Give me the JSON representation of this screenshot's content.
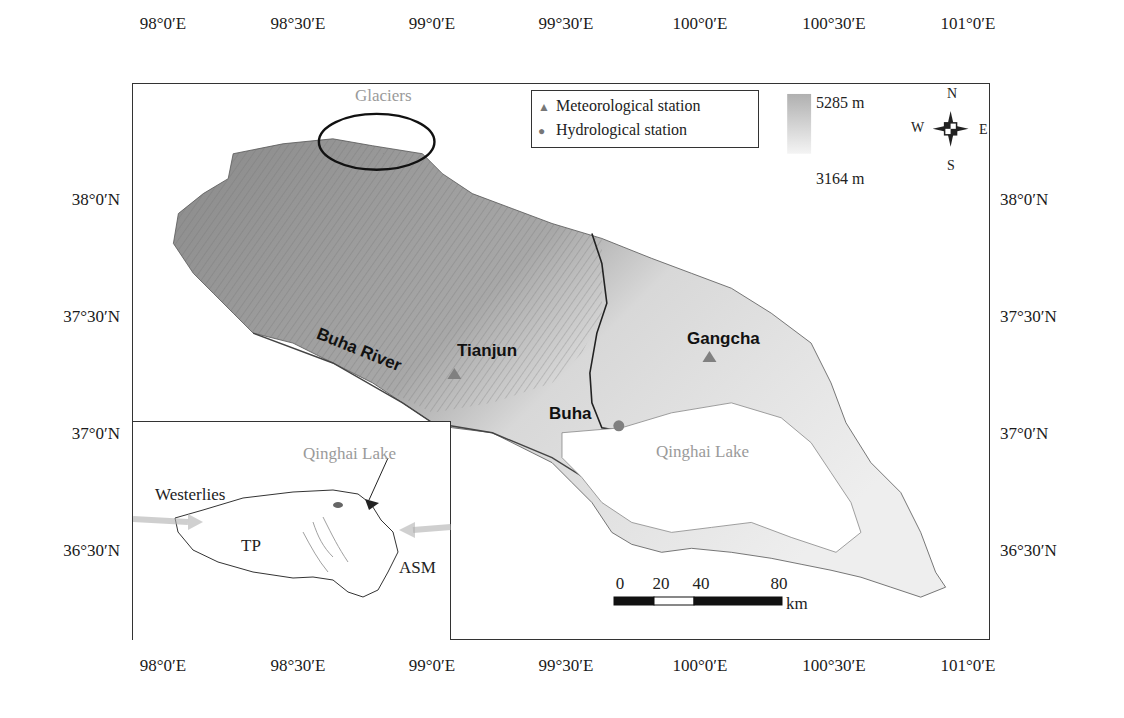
{
  "map": {
    "title": "Buha River basin and Qinghai Lake",
    "x_ticks": [
      "98°0′E",
      "98°30′E",
      "99°0′E",
      "99°30′E",
      "100°0′E",
      "100°30′E",
      "101°0′E"
    ],
    "y_ticks": [
      "38°0′N",
      "37°30′N",
      "37°0′N",
      "36°30′N"
    ],
    "labels": {
      "glaciers": "Glaciers",
      "buha_river": "Buha River",
      "tianjun": "Tianjun",
      "buha": "Buha",
      "gangcha": "Gangcha",
      "qinghai_lake": "Qinghai Lake"
    },
    "legend": {
      "meteorological": "Meteorological station",
      "hydrological": "Hydrological station",
      "triangle_symbol": "▲",
      "circle_symbol": "●"
    },
    "elevation": {
      "max": "5285 m",
      "min": "3164 m"
    },
    "compass": {
      "n": "N",
      "s": "S",
      "e": "E",
      "w": "W"
    },
    "scale": {
      "ticks": [
        "0",
        "20",
        "40",
        "80"
      ],
      "unit": "km"
    },
    "inset": {
      "qinghai_lake": "Qinghai Lake",
      "westerlies": "Westerlies",
      "tp": "TP",
      "asm": "ASM"
    },
    "colors": {
      "frame": "#333333",
      "terrain_dark": "#7a7a7a",
      "terrain_light": "#e6e6e6",
      "grey_label": "#9a9a9a",
      "symbol": "#808080"
    }
  }
}
